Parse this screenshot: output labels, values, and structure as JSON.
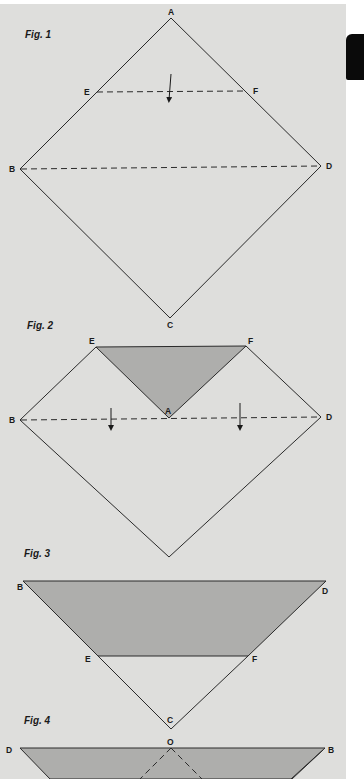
{
  "colors": {
    "page_background": "#dededc",
    "line": "#2a2a2a",
    "shaded_fold": "#aeaeac",
    "tab_mark": "#0a0a0a"
  },
  "figures": [
    {
      "label": "Fig. 1",
      "points": {
        "A": "A",
        "B": "B",
        "C": "C",
        "D": "D",
        "E": "E",
        "F": "F"
      },
      "description": "Square on point with dashed fold lines E–F and B–D, arrow pointing down to fold A to center"
    },
    {
      "label": "Fig. 2",
      "points": {
        "E": "E",
        "F": "F",
        "A": "A",
        "B": "B",
        "D": "D"
      },
      "description": "Top corner A folded down to center forming shaded triangle E-F-A; dashed fold line B–D with two down arrows"
    },
    {
      "label": "Fig. 3",
      "points": {
        "B": "B",
        "D": "D",
        "E": "E",
        "F": "F",
        "C": "C"
      },
      "description": "Folded in half along B–D; shaded trapezoid B-D-F-E above unshaded triangle E-F-C"
    },
    {
      "label": "Fig. 4",
      "points": {
        "D": "D",
        "O": "O",
        "B": "B"
      },
      "description": "Flipped triangle with dashed fold lines from point O"
    }
  ]
}
